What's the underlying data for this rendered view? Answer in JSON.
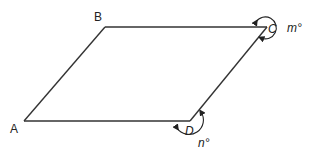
{
  "diagram": {
    "type": "parallelogram",
    "stroke_color": "#333333",
    "vertices": {
      "A": {
        "label": "A",
        "x": 24,
        "y": 121
      },
      "B": {
        "label": "B",
        "x": 105,
        "y": 27
      },
      "C": {
        "label": "C",
        "x": 267,
        "y": 27
      },
      "D": {
        "label": "D",
        "x": 190,
        "y": 121
      }
    },
    "angles": {
      "C": {
        "label": "m°",
        "kind": "reflex-exterior"
      },
      "D": {
        "label": "n°",
        "kind": "exterior"
      }
    }
  }
}
